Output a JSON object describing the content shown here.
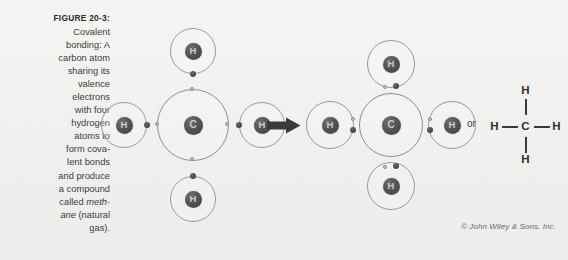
{
  "figure": {
    "label": "FIGURE 20-3:",
    "caption_lines": [
      {
        "text": "Covalent",
        "italic": false
      },
      {
        "text": "bonding: A",
        "italic": false
      },
      {
        "text": "carbon atom",
        "italic": false
      },
      {
        "text": "sharing its",
        "italic": false
      },
      {
        "text": "valence",
        "italic": false
      },
      {
        "text": "electrons",
        "italic": false
      },
      {
        "text": "with four",
        "italic": false
      },
      {
        "text": "hydrogen",
        "italic": false
      },
      {
        "text": "atoms to",
        "italic": false
      },
      {
        "text": "form cova-",
        "italic": false
      },
      {
        "text": "lent bonds",
        "italic": false
      },
      {
        "text": "and produce",
        "italic": false
      },
      {
        "text": "a compound",
        "italic": false
      },
      {
        "text": "called ",
        "italic_suffix": "meth-"
      },
      {
        "text": "",
        "italic_prefix": "ane",
        "suffix": " (natural"
      },
      {
        "text": "gas).",
        "italic": false
      }
    ],
    "caption_full": "Covalent bonding: A carbon atom sharing its valence electrons with four hydrogen atoms to form covalent bonds and produce a compound called methane (natural gas).",
    "credit": "© John Wiley & Sons, Inc."
  },
  "separator": {
    "or_label": "or",
    "arrow_name": "right-arrow"
  },
  "left_diagram": {
    "name": "separate-atoms-diagram",
    "carbon": {
      "symbol": "C",
      "shell_electrons": 4
    },
    "hydrogens": [
      {
        "symbol": "H",
        "position": "top",
        "shell_electrons": 1
      },
      {
        "symbol": "H",
        "position": "left",
        "shell_electrons": 1
      },
      {
        "symbol": "H",
        "position": "right",
        "shell_electrons": 1
      },
      {
        "symbol": "H",
        "position": "bottom",
        "shell_electrons": 1
      }
    ]
  },
  "right_diagram": {
    "name": "methane-molecule-diagram",
    "carbon": {
      "symbol": "C"
    },
    "hydrogens": [
      {
        "symbol": "H",
        "position": "top"
      },
      {
        "symbol": "H",
        "position": "left"
      },
      {
        "symbol": "H",
        "position": "right"
      },
      {
        "symbol": "H",
        "position": "bottom"
      }
    ],
    "shared_pairs": 4
  },
  "structural_formula": {
    "center": "C",
    "top": "H",
    "left": "H",
    "right": "H",
    "bottom": "H"
  },
  "colors": {
    "background": "#f1f1ef",
    "nucleus": "#4d4d4d",
    "orbit": "#8e8e8e",
    "electron_dark": "#4d4d4d",
    "electron_light": "#c6c6c6",
    "text": "#3c3c3c"
  }
}
